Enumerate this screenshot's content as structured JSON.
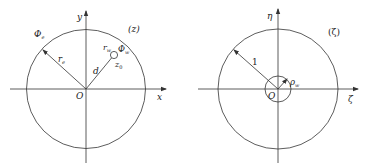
{
  "left_panel": {
    "plane_label": "(z)",
    "x_axis_label": "x",
    "y_axis_label": "y",
    "origin_label": "O",
    "outer_potential_label": "Φ",
    "outer_potential_sub": "e",
    "outer_radius_label": "r",
    "outer_radius_sub": "e",
    "distance_label": "d",
    "well_radius_label": "r",
    "well_radius_sub": "w",
    "well_potential_label": "Φ",
    "well_potential_sub": "w",
    "well_center_label": "z",
    "well_center_sub": "0"
  },
  "right_panel": {
    "plane_label": "(ζ)",
    "x_axis_label": "ζ",
    "y_axis_label": "η",
    "origin_label": "O",
    "outer_radius_label": "1",
    "inner_radius_label": "ρ",
    "inner_radius_sub": "w"
  },
  "colors": {
    "stroke": "#333333",
    "background": "#ffffff"
  }
}
